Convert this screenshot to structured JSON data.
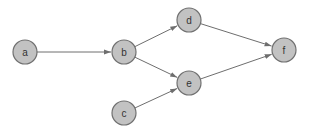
{
  "diagram": {
    "type": "directed-graph",
    "node_radius": 12,
    "colors": {
      "node_fill": "#c2c2c2",
      "node_stroke": "#707070",
      "edge": "#6e6e6e",
      "label": "#333333"
    },
    "nodes": [
      {
        "id": "a",
        "label": "a",
        "x": 25,
        "y": 52
      },
      {
        "id": "b",
        "label": "b",
        "x": 124,
        "y": 52
      },
      {
        "id": "c",
        "label": "c",
        "x": 124,
        "y": 113
      },
      {
        "id": "d",
        "label": "d",
        "x": 189,
        "y": 20
      },
      {
        "id": "e",
        "label": "e",
        "x": 189,
        "y": 83
      },
      {
        "id": "f",
        "label": "f",
        "x": 284,
        "y": 50
      }
    ],
    "edges": [
      {
        "from": "a",
        "to": "b"
      },
      {
        "from": "b",
        "to": "d"
      },
      {
        "from": "b",
        "to": "e"
      },
      {
        "from": "c",
        "to": "e"
      },
      {
        "from": "d",
        "to": "f"
      },
      {
        "from": "e",
        "to": "f"
      }
    ]
  }
}
